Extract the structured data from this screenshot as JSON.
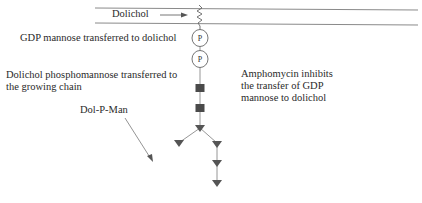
{
  "diagram": {
    "membrane_label": "Dolichol",
    "step1_label": "GDP mannose transferred to dolichol",
    "step2_label_line1": "Dolichol phosphomannose transferred to",
    "step2_label_line2": "the growing chain",
    "dolpman_label": "Dol-P-Man",
    "inhibitor_line1": "Amphomycin inhibits",
    "inhibitor_line2": "the transfer of GDP",
    "inhibitor_line3": "mannose to dolichol",
    "phosphate_symbol": "P",
    "nodes": {
      "phosphates": 2,
      "squares": 2,
      "triangles": 6
    },
    "colors": {
      "line": "#8a8a8a",
      "shape_fill": "#505050",
      "text": "#2a2a2a"
    }
  }
}
